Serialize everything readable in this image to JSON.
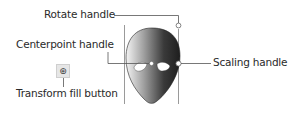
{
  "labels": {
    "rotate": "Rotate handle",
    "centerpoint": "Centerpoint handle",
    "scaling": "Scaling handle",
    "transform": "Transform fill button"
  },
  "icons": {
    "transform_fill": "transform-fill-icon",
    "face": "alien-face-gradient"
  },
  "colors": {
    "leader_line": "#555555",
    "bounding_line": "#9a9a9a",
    "gradient_light": "#f2f2f2",
    "gradient_dark": "#2a2a2a"
  }
}
